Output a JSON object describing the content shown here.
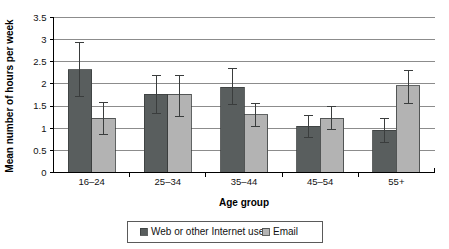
{
  "chart_data": {
    "type": "bar",
    "title": "",
    "xlabel": "Age group",
    "ylabel": "Mean number of hours per week",
    "categories": [
      "16–24",
      "25–34",
      "35–44",
      "45–54",
      "55+"
    ],
    "ylim": [
      0,
      3.5
    ],
    "yticks": [
      "0",
      "0.5",
      "1",
      "1.5",
      "2",
      "2.5",
      "3",
      "3.5"
    ],
    "ytick_values": [
      0,
      0.5,
      1,
      1.5,
      2,
      2.5,
      3,
      3.5
    ],
    "grid": true,
    "legend_position": "bottom",
    "error_bars": true,
    "series": [
      {
        "name": "Web or other Internet use",
        "color": "#595e5e",
        "values": [
          2.32,
          1.77,
          1.93,
          1.05,
          0.95
        ],
        "err_low": [
          1.71,
          1.33,
          1.54,
          0.8,
          0.67
        ],
        "err_high": [
          2.93,
          2.2,
          2.34,
          1.28,
          1.22
        ]
      },
      {
        "name": "Email",
        "color": "#b3b3b3",
        "values": [
          1.22,
          1.77,
          1.3,
          1.22,
          1.96
        ],
        "err_low": [
          0.85,
          1.26,
          1.03,
          0.96,
          1.55
        ],
        "err_high": [
          1.59,
          2.2,
          1.56,
          1.5,
          2.31
        ]
      }
    ]
  },
  "legend": {
    "items": [
      {
        "label": "Web or other Internet use",
        "marker": "square-dark"
      },
      {
        "label": "Email",
        "marker": "square-light"
      }
    ]
  },
  "colors": {
    "series_dark": "#595e5e",
    "series_light": "#b3b3b3",
    "grid": "#8c8c8c",
    "axis": "#000000",
    "text": "#111111",
    "background": "#ffffff"
  }
}
